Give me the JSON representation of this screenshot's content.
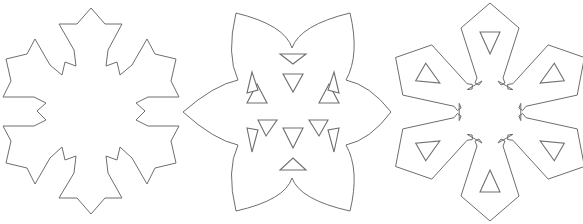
{
  "figure": {
    "width": 583,
    "height": 224,
    "stroke_color": "#6e6e6e",
    "background": "#ffffff",
    "shapes": [
      {
        "id": "snowflake-jagged",
        "center": [
          91,
          112
        ],
        "outline": [
          [
            91,
            8
          ],
          [
            105,
            24
          ],
          [
            122,
            24
          ],
          [
            108,
            50
          ],
          [
            106,
            66
          ],
          [
            117,
            62
          ],
          [
            120,
            75
          ],
          [
            132,
            65
          ],
          [
            147,
            39
          ],
          [
            155,
            54
          ],
          [
            176,
            59
          ],
          [
            171,
            81
          ],
          [
            179,
            97
          ],
          [
            148,
            97
          ],
          [
            136,
            103
          ],
          [
            145,
            111
          ],
          [
            136,
            120
          ],
          [
            148,
            126
          ],
          [
            179,
            126
          ],
          [
            171,
            141
          ],
          [
            176,
            163
          ],
          [
            155,
            168
          ],
          [
            147,
            184
          ],
          [
            132,
            158
          ],
          [
            120,
            147
          ],
          [
            117,
            160
          ],
          [
            106,
            156
          ],
          [
            108,
            173
          ],
          [
            122,
            198
          ],
          [
            105,
            198
          ],
          [
            91,
            214
          ],
          [
            77,
            198
          ],
          [
            59,
            198
          ],
          [
            74,
            173
          ],
          [
            76,
            156
          ],
          [
            65,
            160
          ],
          [
            62,
            147
          ],
          [
            50,
            158
          ],
          [
            35,
            184
          ],
          [
            27,
            168
          ],
          [
            6,
            163
          ],
          [
            11,
            141
          ],
          [
            3,
            126
          ],
          [
            34,
            126
          ],
          [
            46,
            120
          ],
          [
            37,
            111
          ],
          [
            46,
            103
          ],
          [
            34,
            97
          ],
          [
            3,
            97
          ],
          [
            11,
            81
          ],
          [
            6,
            59
          ],
          [
            27,
            54
          ],
          [
            35,
            39
          ],
          [
            50,
            65
          ],
          [
            62,
            75
          ],
          [
            65,
            62
          ],
          [
            76,
            66
          ],
          [
            74,
            50
          ],
          [
            59,
            24
          ],
          [
            77,
            24
          ]
        ],
        "holes": []
      },
      {
        "id": "star-with-triangles",
        "center": [
          292,
          112
        ],
        "outline_path": "M236,13 Q285,25 292,48 Q300,25 350,13 Q360,55 346,80 Q370,85 391,112 Q370,140 346,145 Q360,170 350,211 Q300,200 292,178 Q285,200 236,211 Q226,170 238,145 Q214,140 183,112 Q214,85 238,80 Q226,55 236,13 Z",
        "holes": [
          [
            [
              280,
              54
            ],
            [
              306,
              54
            ],
            [
              293,
              64
            ]
          ],
          [
            [
              283,
              74
            ],
            [
              303,
              74
            ],
            [
              293,
              92
            ]
          ],
          [
            [
              257,
              84
            ],
            [
              247,
              103
            ],
            [
              267,
              103
            ]
          ],
          [
            [
              329,
              84
            ],
            [
              319,
              103
            ],
            [
              339,
              103
            ]
          ],
          [
            [
              252,
              72
            ],
            [
              247,
              93
            ],
            [
              258,
              90
            ]
          ],
          [
            [
              334,
              72
            ],
            [
              339,
              93
            ],
            [
              328,
              90
            ]
          ],
          [
            [
              258,
              120
            ],
            [
              277,
              120
            ],
            [
              266,
              136
            ]
          ],
          [
            [
              309,
              120
            ],
            [
              328,
              120
            ],
            [
              319,
              136
            ]
          ],
          [
            [
              247,
              128
            ],
            [
              258,
              130
            ],
            [
              252,
              152
            ]
          ],
          [
            [
              339,
              128
            ],
            [
              328,
              130
            ],
            [
              334,
              152
            ]
          ],
          [
            [
              283,
              128
            ],
            [
              303,
              128
            ],
            [
              293,
              148
            ]
          ],
          [
            [
              280,
              170
            ],
            [
              306,
              170
            ],
            [
              293,
              158
            ]
          ]
        ]
      },
      {
        "id": "snowflake-blocky",
        "center": [
          490,
          112
        ],
        "arm": [
          [
            0,
            -109
          ],
          [
            29,
            -84
          ],
          [
            13,
            -34
          ],
          [
            15,
            -29
          ],
          [
            11,
            -27
          ],
          [
            8,
            -31
          ]
        ],
        "arm_hole": [
          [
            -10,
            -80
          ],
          [
            10,
            -80
          ],
          [
            0,
            -58
          ]
        ],
        "arm_count": 6
      }
    ]
  }
}
